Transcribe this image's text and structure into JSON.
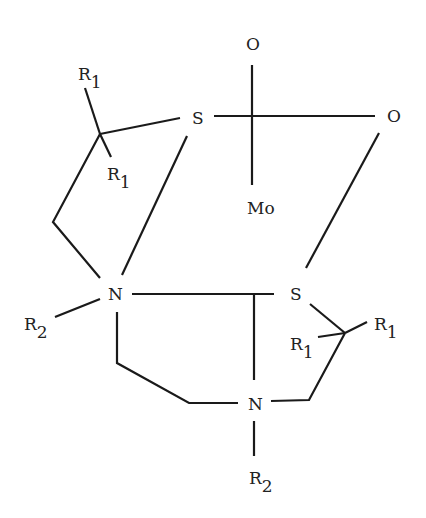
{
  "diagram": {
    "type": "chemical-structure",
    "atoms": {
      "o_top": {
        "label": "O"
      },
      "o_right": {
        "label": "O"
      },
      "mo": {
        "label": "Mo"
      },
      "s_upper": {
        "label": "S"
      },
      "s_lower": {
        "label": "S"
      },
      "n_left": {
        "label": "N"
      },
      "n_bottom": {
        "label": "N"
      }
    },
    "substituents": {
      "r1_top": {
        "label": "R",
        "sub": "1"
      },
      "r1_mid": {
        "label": "R",
        "sub": "1"
      },
      "r1_right": {
        "label": "R",
        "sub": "1"
      },
      "r1_lower_left": {
        "label": "R",
        "sub": "1"
      },
      "r2_left": {
        "label": "R",
        "sub": "2"
      },
      "r2_bottom": {
        "label": "R",
        "sub": "2"
      }
    }
  }
}
